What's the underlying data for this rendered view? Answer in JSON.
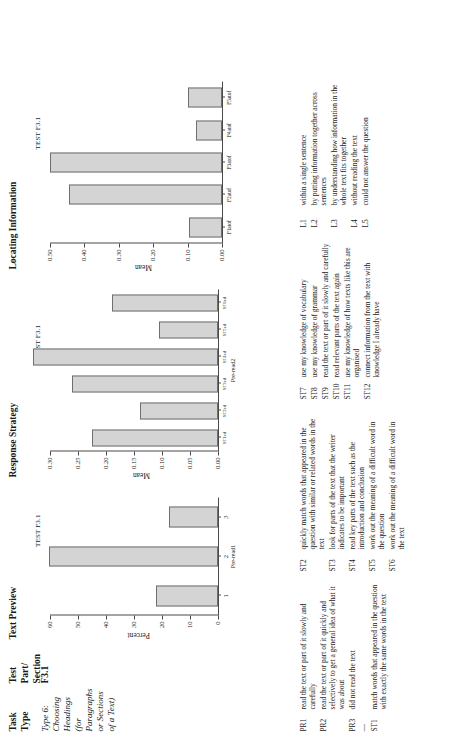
{
  "header": {
    "col_task_type": "Task\nType",
    "col_test_part": "Test\nPart/\nSection",
    "col_text_preview": "Text Preview",
    "col_response_strategy": "Response Strategy",
    "col_locating_information": "Locating Information"
  },
  "row": {
    "task_type": "Type 6: Choosing Headings (for Paragraphs or Sections of a Text)",
    "test_part": "F3.1"
  },
  "chart_data": [
    {
      "type": "bar",
      "id": "text-preview",
      "title": "Text Preview",
      "panel_label": "TEST F3.1",
      "xlabel": "Pre-read1",
      "ylabel": "Percent",
      "categories": [
        "1",
        "2",
        "3"
      ],
      "values": [
        22.0,
        60.5,
        17.5
      ],
      "ylim": [
        0,
        60
      ],
      "yticks": [
        0,
        10,
        20,
        30,
        40,
        50,
        60
      ],
      "ytick_labels": [
        "0",
        "10",
        "20",
        "30",
        "40",
        "50",
        "60"
      ],
      "grid": false,
      "legend": "none"
    },
    {
      "type": "bar",
      "id": "response-strategy",
      "title": "Response Strategy",
      "panel_label": "TEST F3.1",
      "xlabel": "Pre-read2",
      "ylabel": "Mean",
      "categories": [
        "ST1ed",
        "ST2ed",
        "ST3ed",
        "ST4ed",
        "ST5ed",
        "ST6ed"
      ],
      "tick_labels": [
        "ST1ed",
        "ST2ed",
        "ST3ed",
        "ST4ed",
        "ST5ed",
        "ST6ed"
      ],
      "values": [
        0.225,
        0.14,
        0.26,
        0.33,
        0.105,
        0.19
      ],
      "ylim": [
        0,
        0.3
      ],
      "yticks": [
        0.0,
        0.05,
        0.1,
        0.15,
        0.2,
        0.25,
        0.3
      ],
      "ytick_labels": [
        "0.00",
        "0.05",
        "0.10",
        "0.15",
        "0.20",
        "0.25",
        "0.30"
      ],
      "grid": false,
      "legend": "none"
    },
    {
      "type": "bar",
      "id": "locating-information",
      "title": "Locating Information",
      "panel_label": "TEST F3.1",
      "xlabel": "",
      "ylabel": "Mean",
      "categories": [
        "F1atof",
        "F2atof",
        "F3atof",
        "F4atof",
        "F5atof"
      ],
      "tick_labels": [
        "F1atof",
        "F2atof",
        "F3atof",
        "F4atof",
        "F5atof"
      ],
      "values": [
        0.095,
        0.445,
        0.5,
        0.075,
        0.1
      ],
      "ylim": [
        0,
        0.5
      ],
      "yticks": [
        0.0,
        0.1,
        0.2,
        0.3,
        0.4,
        0.5
      ],
      "ytick_labels": [
        "0.00",
        "0.10",
        "0.20",
        "0.30",
        "0.40",
        "0.50"
      ],
      "grid": false,
      "legend": "none"
    }
  ],
  "legend": {
    "col1": [
      {
        "code": "PR1",
        "text": "read the text or part of it slowly and carefully"
      },
      {
        "code": "PR2",
        "text": "read the text or part of it quickly and selectively to get a general idea of what it was about"
      },
      {
        "code": "PR3",
        "text": "did not read the text"
      },
      {
        "code": "—",
        "text": ""
      },
      {
        "code": "ST1",
        "text": "match words that appeared in the question with exactly the same words in the text"
      }
    ],
    "col2": [
      {
        "code": "ST2",
        "text": "quickly match words that appeared in the question with similar or related words in the text"
      },
      {
        "code": "ST3",
        "text": "look for parts of the text that the writer indicates to be important"
      },
      {
        "code": "ST4",
        "text": "read key parts of the text such as the introduction and conclusion"
      },
      {
        "code": "ST5",
        "text": "work out the meaning of a difficult word in the question"
      },
      {
        "code": "ST6",
        "text": "work out the meaning of a difficult word in the text"
      }
    ],
    "col3": [
      {
        "code": "ST7",
        "text": "use my knowledge of vocabulary"
      },
      {
        "code": "ST8",
        "text": "use my knowledge of grammar"
      },
      {
        "code": "ST9",
        "text": "read the text or part of it slowly and carefully"
      },
      {
        "code": "ST10",
        "text": "read relevant parts of the text again"
      },
      {
        "code": "ST11",
        "text": "use my knowledge of how texts like this are organised"
      },
      {
        "code": "ST12",
        "text": "connect information from the text with knowledge I already have"
      }
    ],
    "col4": [
      {
        "code": "L1",
        "text": "within a single sentence"
      },
      {
        "code": "L2",
        "text": "by putting information together across sentences"
      },
      {
        "code": "L3",
        "text": "by understanding how information in the whole text fits together"
      },
      {
        "code": "L4",
        "text": "without reading the text"
      },
      {
        "code": "L5",
        "text": "could not answer the question"
      }
    ]
  },
  "colors": {
    "bar_fill": "#d4d4d4",
    "bar_stroke": "#6f6f6f",
    "axis": "#4a4a4a",
    "text": "#1a1a1a"
  }
}
